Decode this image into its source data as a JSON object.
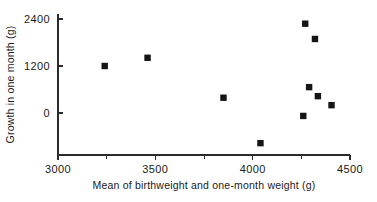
{
  "chart_data": {
    "type": "scatter",
    "title": "",
    "xlabel": "Mean of birthweight and one-month weight (g)",
    "ylabel": "Growth in one month (g)",
    "xlim": [
      3000,
      4500
    ],
    "ylim": [
      -900,
      2400
    ],
    "grid": false,
    "legend": false,
    "x_ticks": [
      3000,
      3500,
      4000,
      4500
    ],
    "x_tick_labels": [
      "3000",
      "3500",
      "4000",
      "4500"
    ],
    "x_minor_ticks": [
      3250,
      3750,
      4250
    ],
    "y_ticks": [
      0,
      1200,
      2400
    ],
    "y_tick_labels": [
      "0",
      "1200",
      "2400"
    ],
    "marker": "square",
    "marker_color": "#151515",
    "points": [
      {
        "x": 3240,
        "y": 1200
      },
      {
        "x": 3460,
        "y": 1410
      },
      {
        "x": 3850,
        "y": 390
      },
      {
        "x": 4040,
        "y": -770
      },
      {
        "x": 4270,
        "y": 2280
      },
      {
        "x": 4320,
        "y": 1890
      },
      {
        "x": 4290,
        "y": 660
      },
      {
        "x": 4335,
        "y": 430
      },
      {
        "x": 4405,
        "y": 200
      },
      {
        "x": 4260,
        "y": -75
      }
    ]
  },
  "axis": {
    "x_label": "Mean of birthweight and one-month weight (g)",
    "y_label": "Growth in one month (g)"
  }
}
